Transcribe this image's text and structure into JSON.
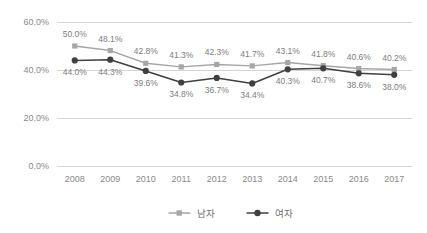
{
  "chart_data": {
    "type": "line",
    "title": "",
    "subtitle": "",
    "xlabel": "",
    "ylabel": "",
    "ylim": [
      0,
      60
    ],
    "yticks": [
      0,
      20,
      40,
      60
    ],
    "ytick_labels": [
      "0.0%",
      "20.0%",
      "40.0%",
      "60.0%"
    ],
    "grid": true,
    "legend_position": "bottom",
    "categories": [
      "2008",
      "2009",
      "2010",
      "2011",
      "2012",
      "2013",
      "2014",
      "2015",
      "2016",
      "2017"
    ],
    "series": [
      {
        "name": "남자",
        "marker": "square",
        "color": "#a6a6a6",
        "values": [
          50.0,
          48.1,
          42.8,
          41.3,
          42.3,
          41.7,
          43.1,
          41.8,
          40.6,
          40.2
        ],
        "labels": [
          "50.0%",
          "48.1%",
          "42.8%",
          "41.3%",
          "42.3%",
          "41.7%",
          "43.1%",
          "41.8%",
          "40.6%",
          "40.2%"
        ],
        "label_position": "above"
      },
      {
        "name": "여자",
        "marker": "circle",
        "color": "#404040",
        "values": [
          44.0,
          44.3,
          39.6,
          34.8,
          36.7,
          34.4,
          40.3,
          40.7,
          38.6,
          38.0
        ],
        "labels": [
          "44.0%",
          "44.3%",
          "39.6%",
          "34.8%",
          "36.7%",
          "34.4%",
          "40.3%",
          "40.7%",
          "38.6%",
          "38.0%"
        ],
        "label_position": "below"
      }
    ]
  },
  "legend": {
    "items": [
      {
        "label": "남자",
        "color": "#a6a6a6",
        "marker": "square"
      },
      {
        "label": "여자",
        "color": "#404040",
        "marker": "circle"
      }
    ]
  },
  "colors": {
    "background": "#ffffff",
    "gridline": "#d4d4d4",
    "axis_text": "#8a8a8a",
    "data_label": "#7d7d7d",
    "series_male": "#a6a6a6",
    "series_female": "#404040"
  }
}
